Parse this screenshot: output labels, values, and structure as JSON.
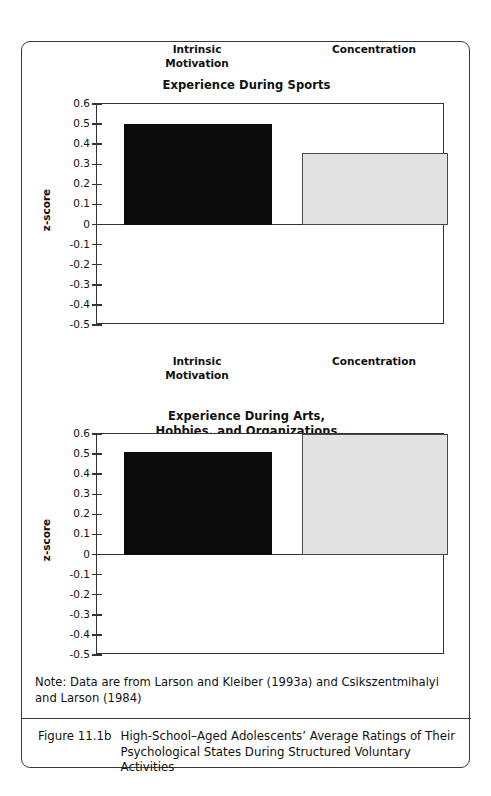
{
  "figure": {
    "note": "Note: Data are from Larson and Kleiber (1993a) and Csikszentmihalyi and Larson (1984)",
    "caption_number": "Figure 11.1b",
    "caption_text": "High-School–Aged Adolescents’ Average Ratings of Their Psychological States During Structured Voluntary Activities"
  },
  "axis": {
    "ylabel": "z-score",
    "ticks": [
      "0.6",
      "0.5",
      "0.4",
      "0.3",
      "0.2",
      "0.1",
      "0",
      "-0.1",
      "-0.2",
      "-0.3",
      "-0.4",
      "-0.5"
    ]
  },
  "colors": {
    "bar_dark": "#0b0b0b",
    "bar_light": "#e2e2e2",
    "bar_light_border": "#4a4a4a",
    "axis": "#333333",
    "frame": "#3a3a3a"
  },
  "chart_data": [
    {
      "type": "bar",
      "title": "Experience During Sports",
      "title_lines": [
        "Experience During Sports"
      ],
      "categories": [
        "Intrinsic Motivation",
        "Concentration"
      ],
      "category_lines": [
        [
          "Intrinsic",
          "Motivation"
        ],
        [
          "Concentration"
        ]
      ],
      "values": [
        0.5,
        0.355
      ],
      "xlabel": "",
      "ylabel": "z-score",
      "ylim": [
        -0.5,
        0.6
      ],
      "ytick_step": 0.1,
      "grid": false,
      "legend": "none",
      "bar_styles": [
        "dark",
        "light"
      ]
    },
    {
      "type": "bar",
      "title": "Experience During Arts, Hobbies, and Organizations",
      "title_lines": [
        "Experience During Arts,",
        "Hobbies, and Organizations"
      ],
      "categories": [
        "Intrinsic Motivation",
        "Concentration"
      ],
      "category_lines": [
        [
          "Intrinsic",
          "Motivation"
        ],
        [
          "Concentration"
        ]
      ],
      "values": [
        0.51,
        0.6
      ],
      "xlabel": "",
      "ylabel": "z-score",
      "ylim": [
        -0.5,
        0.6
      ],
      "ytick_step": 0.1,
      "grid": false,
      "legend": "none",
      "bar_styles": [
        "dark",
        "light"
      ]
    }
  ]
}
